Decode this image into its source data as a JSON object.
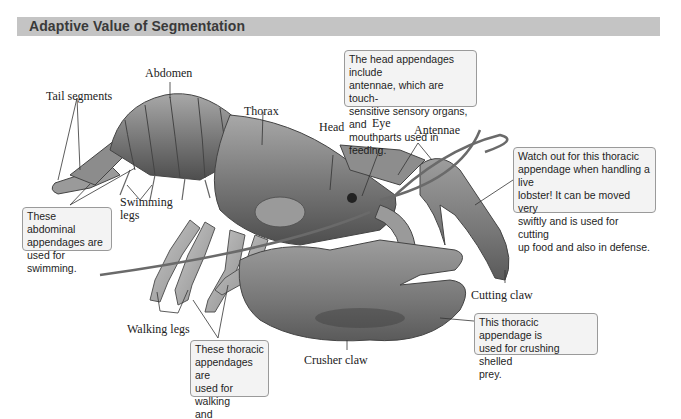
{
  "header": {
    "title": "Adaptive Value of Segmentation",
    "bar_color": "#c4c4c4"
  },
  "labels": {
    "abdomen": "Abdomen",
    "tail_segments": "Tail segments",
    "thorax": "Thorax",
    "head": "Head",
    "eye": "Eye",
    "antennae": "Antennae",
    "swimming_legs": "Swimming\nlegs",
    "walking_legs": "Walking legs",
    "crusher_claw": "Crusher claw",
    "cutting_claw": "Cutting claw"
  },
  "callouts": {
    "head_appendages": "The head appendages include\nantennae, which are touch-\nsensitive sensory organs, and\nmouthparts used in feeding.",
    "cutting_claw": "Watch out for this thoracic\nappendage when handling a live\nlobster! It can be moved very\nswiftly and is used for cutting\nup food and also in defense.",
    "abdominal": "These abdominal\nappendages are\nused for swimming.",
    "walking": "These thoracic\nappendages are\nused for walking\nand burrowing.",
    "crusher_claw": "This thoracic appendage is\nused for crushing shelled\nprey."
  },
  "colors": {
    "body_dark": "#5a5a5a",
    "body_mid": "#8a8a8a",
    "body_light": "#b8b8b8",
    "callout_bg": "#f3f3f3",
    "callout_border": "#9a9a9a"
  }
}
